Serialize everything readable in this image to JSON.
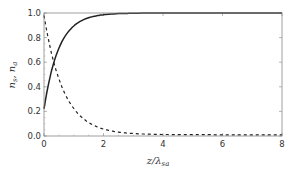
{
  "chart_data": {
    "type": "line",
    "title": "",
    "xlabel": "z/λ_sa",
    "ylabel": "n_s, n_a",
    "xlim": [
      0,
      8
    ],
    "ylim": [
      0,
      1
    ],
    "xticks": [
      "0",
      "2",
      "4",
      "6",
      "8"
    ],
    "yticks": [
      "0.0",
      "0.2",
      "0.4",
      "0.6",
      "0.8",
      "1.0"
    ],
    "grid": false,
    "legend": null,
    "x": [
      0,
      0.25,
      0.5,
      0.75,
      1.0,
      1.5,
      2.0,
      3.0,
      4.0,
      5.0,
      6.0,
      7.0,
      8.0
    ],
    "series": [
      {
        "name": "n_s",
        "style": "solid",
        "color": "#222222",
        "values": [
          0.22,
          0.53,
          0.71,
          0.83,
          0.89,
          0.96,
          0.99,
          1.0,
          1.0,
          1.0,
          1.0,
          1.0,
          1.0
        ]
      },
      {
        "name": "n_a",
        "style": "dashed",
        "color": "#222222",
        "values": [
          0.98,
          0.7,
          0.5,
          0.32,
          0.22,
          0.11,
          0.05,
          0.02,
          0.01,
          0.01,
          0.01,
          0.01,
          0.01
        ]
      }
    ]
  },
  "axes": {
    "xlabel_main": "z/λ",
    "xlabel_sub": "sa",
    "ylabel_text": "n",
    "ylabel_sub1": "s",
    "ylabel_sep": ", ",
    "ylabel_sub2": "a"
  }
}
